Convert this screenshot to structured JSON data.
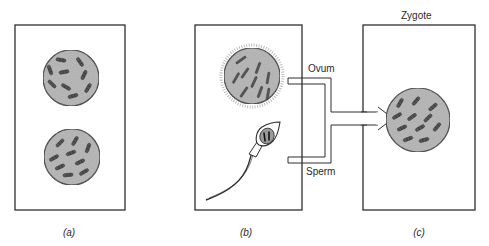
{
  "figure": {
    "panels": [
      {
        "id": "a",
        "caption": "(a)",
        "contents": [
          "diploid-cell-1",
          "diploid-cell-2"
        ]
      },
      {
        "id": "b",
        "caption": "(b)",
        "contents": [
          "ovum",
          "sperm"
        ]
      },
      {
        "id": "c",
        "caption": "(c)",
        "title": "Zygote",
        "contents": [
          "zygote-cell"
        ]
      }
    ],
    "connector": {
      "top_label": "Ovum",
      "bottom_label": "Sperm",
      "target": "Zygote"
    },
    "colors": {
      "outline": "#2e2e2e",
      "cell_fill": "#b4b4b4",
      "chromosome": "#4a4a4a",
      "background": "#ffffff"
    }
  }
}
